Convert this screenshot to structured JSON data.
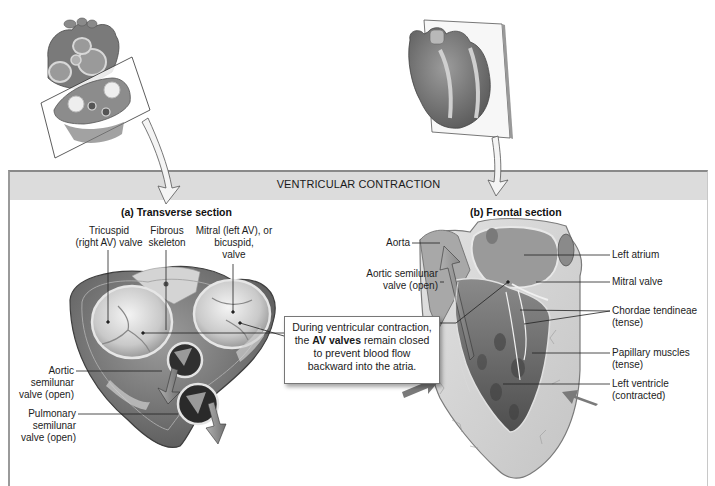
{
  "figure": {
    "banner_title": "VENTRICULAR CONTRACTION",
    "colors": {
      "banner_bg": "#dcdcdc",
      "frame": "#9a9a9a",
      "tissue_dark": "#5a5a5a",
      "tissue_mid": "#8c8c8c",
      "tissue_light": "#d8d8d8",
      "callout_border": "#777777",
      "arrow_fill": "#7a7a7a"
    }
  },
  "thumbnails": {
    "transverse": {
      "icon": "heart-transverse-cut-icon",
      "description": "Heart with transverse cutting plane"
    },
    "frontal": {
      "icon": "heart-frontal-plane-icon",
      "description": "Heart with frontal plane"
    }
  },
  "transverse": {
    "title": "(a) Transverse section",
    "labels": {
      "tricuspid": [
        "Tricuspid",
        "(right AV) valve"
      ],
      "fibrous": [
        "Fibrous",
        "skeleton"
      ],
      "mitral": [
        "Mitral (left AV), or",
        "bicuspid,",
        "valve"
      ],
      "aortic": [
        "Aortic",
        "semilunar",
        "valve (open)"
      ],
      "pulmonary": [
        "Pulmonary",
        "semilunar",
        "valve (open)"
      ]
    }
  },
  "frontal": {
    "title": "(b) Frontal section",
    "labels": {
      "aorta": "Aorta",
      "aortic_semilunar": [
        "Aortic semilunar",
        "valve (open)"
      ],
      "left_atrium": "Left atrium",
      "mitral_valve": "Mitral valve",
      "chordae": [
        "Chordae tendineae",
        "(tense)"
      ],
      "papillary": [
        "Papillary muscles",
        "(tense)"
      ],
      "left_ventricle": [
        "Left ventricle",
        "(contracted)"
      ]
    }
  },
  "callout": {
    "line1": "During ventricular contraction,",
    "line2_prefix": "the ",
    "line2_bold": "AV valves",
    "line2_suffix": " remain closed",
    "line3": "to prevent blood flow",
    "line4": "backward into the atria."
  }
}
